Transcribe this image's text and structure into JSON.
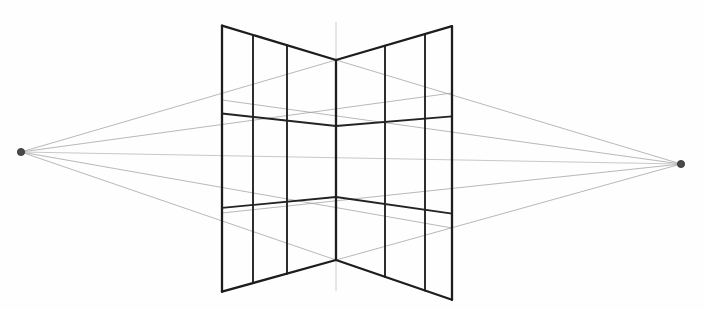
{
  "figure": {
    "background_color": "#fefefe",
    "width": 704,
    "height": 310
  },
  "colors": {
    "cube_edge": "#1d1d1d",
    "cube_grid": "#232323",
    "guide_line": "#9a9a9a",
    "horizon_line": "#c2c2c2",
    "vertical_axis": "#c8c8c8",
    "vanishing_point_dot": "#4a4a4a"
  },
  "vanishing_points": {
    "left": {
      "label": "left-vanishing-point",
      "x": 21,
      "y": 152,
      "radius": 3.6
    },
    "right": {
      "label": "right-vanishing-point",
      "x": 681,
      "y": 164,
      "radius": 3.6
    }
  },
  "horizon": {
    "label": "horizon-line",
    "x1": 21,
    "y1": 152,
    "x2": 681,
    "y2": 164
  },
  "vertical_axis": {
    "label": "vertical-axis-line",
    "x": 336,
    "y_top": 22,
    "y_bottom": 291
  },
  "cube": {
    "front_edge": {
      "x": 336,
      "y_top": 60,
      "y_bottom": 260
    },
    "left_back_edge": {
      "x": 222,
      "y_top": 100,
      "y_bottom": 213
    },
    "right_back_edge": {
      "x": 452,
      "y_top": 93,
      "y_bottom": 228
    },
    "left_face": {
      "label": "left-face",
      "vertical_x": [
        222,
        253,
        287,
        336
      ],
      "vertical_tops": [
        100,
        108,
        119,
        60
      ],
      "vertical_bottoms": [
        213,
        222,
        234,
        260
      ],
      "horizontal_bands_y_at_front": [
        126,
        197
      ],
      "horizontal_bands_y_at_back": [
        131,
        186
      ]
    },
    "right_face": {
      "label": "right-face",
      "vertical_x": [
        336,
        385,
        425,
        452
      ],
      "vertical_tops": [
        60,
        77,
        87,
        93
      ],
      "vertical_bottoms": [
        260,
        243,
        233,
        228
      ],
      "horizontal_bands_y_at_front": [
        126,
        197
      ],
      "horizontal_bands_y_at_back": [
        135,
        184
      ]
    },
    "grid_rows": 3,
    "grid_columns_per_face": 3
  },
  "guide_lines": [
    {
      "label": "lvp-to-front-top",
      "x1": 21,
      "y1": 152,
      "x2": 336,
      "y2": 60
    },
    {
      "label": "lvp-to-front-bottom",
      "x1": 21,
      "y1": 152,
      "x2": 336,
      "y2": 260
    },
    {
      "label": "lvp-to-right-top",
      "x1": 21,
      "y1": 152,
      "x2": 452,
      "y2": 93
    },
    {
      "label": "lvp-to-right-bottom",
      "x1": 21,
      "y1": 152,
      "x2": 452,
      "y2": 228
    },
    {
      "label": "rvp-to-front-top",
      "x1": 681,
      "y1": 164,
      "x2": 336,
      "y2": 60
    },
    {
      "label": "rvp-to-front-bottom",
      "x1": 681,
      "y1": 164,
      "x2": 336,
      "y2": 260
    },
    {
      "label": "rvp-to-left-top",
      "x1": 681,
      "y1": 164,
      "x2": 222,
      "y2": 100
    },
    {
      "label": "rvp-to-left-bottom",
      "x1": 681,
      "y1": 164,
      "x2": 222,
      "y2": 213
    }
  ]
}
